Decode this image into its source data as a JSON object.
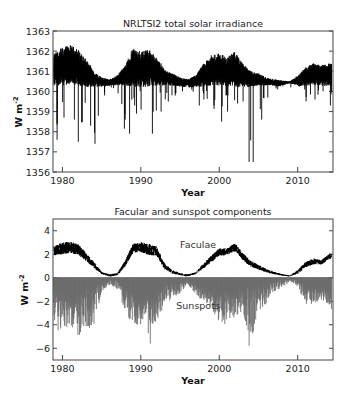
{
  "chart_data": [
    {
      "type": "line",
      "title": "NRLTSI2 total solar irradiance",
      "xlabel": "Year",
      "ylabel": "W m⁻²",
      "xlim": [
        1978.8,
        2014.5
      ],
      "ylim": [
        1356,
        1363
      ],
      "xticks": [
        1980,
        1990,
        2000,
        2010
      ],
      "yticks": [
        1356,
        1357,
        1358,
        1359,
        1360,
        1361,
        1362,
        1363
      ],
      "grid": false,
      "series": [
        {
          "name": "TSI",
          "color": "#000000",
          "x": [
            1979,
            1980,
            1981,
            1982,
            1983,
            1984,
            1985,
            1986,
            1987,
            1988,
            1989,
            1990,
            1991,
            1992,
            1993,
            1994,
            1995,
            1996,
            1997,
            1998,
            1999,
            2000,
            2001,
            2002,
            2003,
            2004,
            2005,
            2006,
            2007,
            2008,
            2009,
            2010,
            2011,
            2012,
            2013,
            2014
          ],
          "upper": [
            1361.9,
            1362.2,
            1362.3,
            1362.1,
            1361.6,
            1361.0,
            1360.7,
            1360.6,
            1360.8,
            1361.3,
            1362.2,
            1362.0,
            1362.1,
            1361.7,
            1361.1,
            1360.9,
            1360.7,
            1360.6,
            1360.8,
            1361.4,
            1361.8,
            1361.9,
            1361.7,
            1362.0,
            1361.4,
            1361.0,
            1360.9,
            1360.7,
            1360.6,
            1360.55,
            1360.5,
            1360.8,
            1361.2,
            1361.4,
            1361.3,
            1361.4
          ],
          "lower": [
            1357.6,
            1358.7,
            1358.6,
            1357.5,
            1358.3,
            1357.4,
            1359.8,
            1360.2,
            1359.9,
            1357.9,
            1358.9,
            1359.1,
            1357.9,
            1359.0,
            1359.5,
            1359.8,
            1360.0,
            1360.3,
            1359.3,
            1359.6,
            1359.3,
            1358.5,
            1359.0,
            1359.4,
            1359.5,
            1356.5,
            1358.6,
            1359.7,
            1360.1,
            1360.3,
            1360.4,
            1360.3,
            1359.5,
            1359.6,
            1360.0,
            1359.3
          ],
          "min_annotation": {
            "x": 2003.8,
            "y": 1356.5
          }
        }
      ]
    },
    {
      "type": "line",
      "title": "Facular and sunspot components",
      "xlabel": "Year",
      "ylabel": "W m⁻²",
      "xlim": [
        1978.8,
        2014.5
      ],
      "ylim": [
        -7,
        5
      ],
      "xticks": [
        1980,
        1990,
        2000,
        2010
      ],
      "yticks": [
        -6,
        -4,
        -2,
        0,
        2,
        4
      ],
      "grid": false,
      "series": [
        {
          "name": "Faculae",
          "color": "#000000",
          "x": [
            1979,
            1980,
            1981,
            1982,
            1983,
            1984,
            1985,
            1986,
            1987,
            1988,
            1989,
            1990,
            1991,
            1992,
            1993,
            1994,
            1995,
            1996,
            1997,
            1998,
            1999,
            2000,
            2001,
            2002,
            2003,
            2004,
            2005,
            2006,
            2007,
            2008,
            2009,
            2010,
            2011,
            2012,
            2013,
            2014
          ],
          "center": [
            2.3,
            2.5,
            2.6,
            2.4,
            1.8,
            1.1,
            0.4,
            0.2,
            0.3,
            1.2,
            2.5,
            2.6,
            2.4,
            2.3,
            1.0,
            0.5,
            0.3,
            0.2,
            0.4,
            1.0,
            1.6,
            2.2,
            2.2,
            2.6,
            1.8,
            1.2,
            0.9,
            0.6,
            0.4,
            0.25,
            0.15,
            0.5,
            1.1,
            1.4,
            1.3,
            1.8
          ],
          "spread": [
            0.8,
            1.0,
            1.0,
            0.9,
            0.7,
            0.5,
            0.2,
            0.2,
            0.2,
            0.5,
            0.8,
            0.9,
            1.0,
            0.8,
            0.5,
            0.3,
            0.2,
            0.2,
            0.2,
            0.4,
            0.6,
            0.6,
            0.6,
            0.7,
            0.6,
            0.5,
            0.4,
            0.3,
            0.2,
            0.15,
            0.1,
            0.3,
            0.5,
            0.5,
            0.4,
            0.5
          ]
        },
        {
          "name": "Sunspots",
          "color": "#6e6e6e",
          "x": [
            1979,
            1980,
            1981,
            1982,
            1983,
            1984,
            1985,
            1986,
            1987,
            1988,
            1989,
            1990,
            1991,
            1992,
            1993,
            1994,
            1995,
            1996,
            1997,
            1998,
            1999,
            2000,
            2001,
            2002,
            2003,
            2004,
            2005,
            2006,
            2007,
            2008,
            2009,
            2010,
            2011,
            2012,
            2013,
            2014
          ],
          "base": [
            -1.0,
            -1.2,
            -1.4,
            -1.3,
            -0.9,
            -0.6,
            -0.3,
            -0.1,
            -0.2,
            -0.8,
            -1.3,
            -1.6,
            -1.5,
            -1.2,
            -0.6,
            -0.4,
            -0.3,
            -0.1,
            -0.3,
            -0.7,
            -1.0,
            -1.3,
            -1.2,
            -1.1,
            -0.8,
            -0.6,
            -0.5,
            -0.3,
            -0.2,
            -0.1,
            -0.05,
            -0.2,
            -0.6,
            -0.8,
            -0.7,
            -1.0
          ],
          "min": [
            -4.7,
            -4.9,
            -4.5,
            -5.0,
            -4.4,
            -4.4,
            -1.2,
            -0.6,
            -1.0,
            -3.0,
            -4.4,
            -4.0,
            -5.6,
            -3.7,
            -2.5,
            -1.8,
            -1.4,
            -0.6,
            -1.5,
            -2.0,
            -2.5,
            -4.1,
            -3.9,
            -3.4,
            -2.8,
            -5.8,
            -2.9,
            -2.2,
            -1.4,
            -0.8,
            -0.4,
            -0.8,
            -2.3,
            -2.3,
            -1.9,
            -2.9
          ]
        }
      ],
      "annotations": [
        {
          "text": "Faculae",
          "x": 1997.3,
          "y": 2.5
        },
        {
          "text": "Sunspots",
          "x": 1997.3,
          "y": -2.7
        }
      ]
    }
  ],
  "labels": {
    "top_title": "NRLTSI2 total solar irradiance",
    "bottom_title": "Facular and sunspot components",
    "xlabel": "Year",
    "ylabel": "W m",
    "ylabel_sup": "-2",
    "faculae": "Faculae",
    "sunspots": "Sunspots"
  }
}
